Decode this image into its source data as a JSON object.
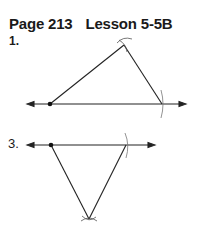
{
  "header": {
    "page": "Page 213",
    "lesson": "Lesson 5-5B"
  },
  "problems": [
    {
      "number": "1.",
      "figure": "triangle-construction-above-line"
    },
    {
      "number": "3.",
      "figure": "triangle-construction-below-line"
    }
  ],
  "colors": {
    "ink": "#1a1a1a",
    "arc": "#555555"
  }
}
